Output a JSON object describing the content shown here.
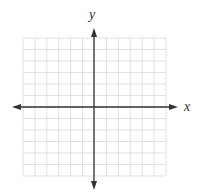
{
  "diagram": {
    "type": "coordinate-plane",
    "grid": {
      "left": 23,
      "top": 38,
      "right": 166,
      "bottom": 176,
      "columns": 12,
      "rows": 12,
      "line_color": "#d9d9d9"
    },
    "axes": {
      "color": "#333333",
      "origin_x": 94,
      "origin_y": 107,
      "x_start": 12,
      "x_end": 178,
      "y_start": 28,
      "y_end": 190
    },
    "labels": {
      "x_axis": "x",
      "y_axis": "y"
    }
  }
}
